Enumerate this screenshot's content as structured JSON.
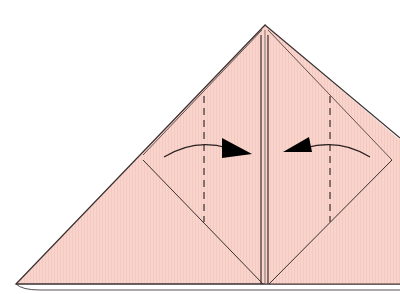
{
  "diagram": {
    "type": "origami-step",
    "colors": {
      "paper": "#f9d4cc",
      "paper_stripe": "#f3c7be",
      "edge": "#3a3030",
      "back_layer": "#f5c85a",
      "background": "#ffffff"
    },
    "elements": [
      {
        "name": "outer-triangle",
        "kind": "paper-shape"
      },
      {
        "name": "left-diamond-flap",
        "kind": "paper-flap"
      },
      {
        "name": "right-diamond-flap",
        "kind": "paper-flap"
      },
      {
        "name": "center-crease",
        "kind": "crease"
      },
      {
        "name": "left-valley-fold-line",
        "kind": "dashed-line"
      },
      {
        "name": "right-valley-fold-line",
        "kind": "dashed-line"
      },
      {
        "name": "left-fold-arrow",
        "kind": "arrow",
        "direction": "right"
      },
      {
        "name": "right-fold-arrow",
        "kind": "arrow",
        "direction": "left"
      }
    ]
  }
}
